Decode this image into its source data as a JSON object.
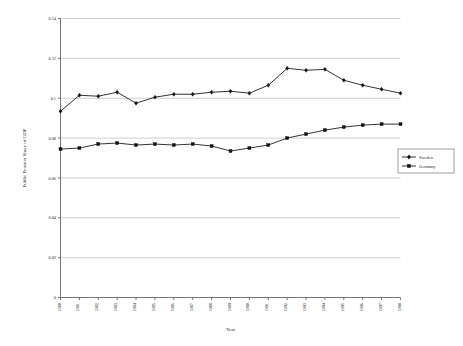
{
  "chart_data": {
    "type": "line",
    "title": "",
    "xlabel": "Year",
    "ylabel": "Public Pension Share of GDP",
    "grid": true,
    "legend_position": "right",
    "xlim": [
      1980,
      1998
    ],
    "ylim": [
      0,
      0.14
    ],
    "yticks": [
      0,
      0.02,
      0.04,
      0.06,
      0.08,
      0.1,
      0.12,
      0.14
    ],
    "ytick_labels": [
      "0",
      "0.02",
      "0.04",
      "0.06",
      "0.08",
      "0.1",
      "0.12",
      "0.14"
    ],
    "categories": [
      1980,
      1981,
      1982,
      1983,
      1984,
      1985,
      1986,
      1987,
      1988,
      1989,
      1990,
      1991,
      1992,
      1993,
      1994,
      1995,
      1996,
      1997,
      1998
    ],
    "xtick_labels": [
      "1980",
      "1981",
      "1982",
      "1983",
      "1984",
      "1985",
      "1986",
      "1987",
      "1988",
      "1989",
      "1990",
      "1991",
      "1992",
      "1993",
      "1994",
      "1995",
      "1996",
      "1997",
      "1998"
    ],
    "series": [
      {
        "name": "Sweden",
        "marker": "diamond",
        "color": "#111111",
        "values": [
          0.0935,
          0.1015,
          0.101,
          0.103,
          0.0975,
          0.1005,
          0.102,
          0.102,
          0.103,
          0.1035,
          0.1025,
          0.1065,
          0.115,
          0.114,
          0.1145,
          0.109,
          0.1065,
          0.1045,
          0.1025
        ]
      },
      {
        "name": "Germany",
        "marker": "square",
        "color": "#111111",
        "values": [
          0.0745,
          0.075,
          0.077,
          0.0775,
          0.0765,
          0.077,
          0.0765,
          0.077,
          0.076,
          0.0735,
          0.075,
          0.0765,
          0.08,
          0.082,
          0.084,
          0.0855,
          0.0865,
          0.087,
          0.087
        ]
      }
    ]
  },
  "legend": {
    "entries": [
      {
        "label": "Sweden",
        "marker": "diamond"
      },
      {
        "label": "Germany",
        "marker": "square"
      }
    ]
  }
}
